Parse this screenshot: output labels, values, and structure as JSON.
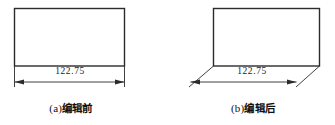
{
  "document": {
    "type": "technical-illustration",
    "description": "CAD dimension editing comparison figure"
  },
  "figures": [
    {
      "id": "figure-a",
      "caption_label": "(a)",
      "caption_text": "编辑前",
      "caption_full": "(a) 编辑前",
      "dimension_value": "122.75",
      "shape": "rectangle",
      "dimension_style": "orthogonal",
      "geometry": {
        "rect": {
          "x": 14,
          "y": 8,
          "width": 111,
          "height": 58
        },
        "dim_line_y": 82,
        "dim_line_x1": 14,
        "dim_line_x2": 125
      }
    },
    {
      "id": "figure-b",
      "caption_label": "(b)",
      "caption_text": "编辑后",
      "caption_full": "(b) 编辑后",
      "dimension_value": "122.75",
      "shape": "rectangle",
      "dimension_style": "oblique",
      "geometry": {
        "rect": {
          "x": 213,
          "y": 8,
          "width": 107,
          "height": 58
        },
        "dim_line_y": 82,
        "dim_line_x1": 190,
        "dim_line_x2": 297
      }
    }
  ],
  "colors": {
    "line": "#2b2b2b",
    "text": "#1a1a1a",
    "background": "#ffffff"
  }
}
